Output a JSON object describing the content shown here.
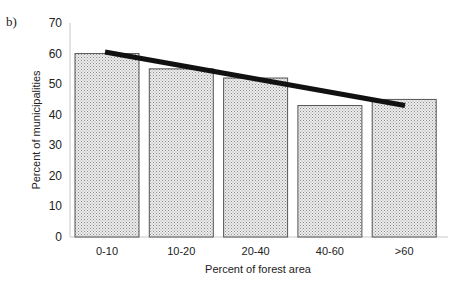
{
  "panel_label": "b)",
  "chart_data": {
    "type": "bar",
    "title": "",
    "xlabel": "Percent of forest area",
    "ylabel": "Percent of municipalities",
    "categories": [
      "0-10",
      "10-20",
      "20-40",
      "40-60",
      ">60"
    ],
    "values": [
      60,
      55,
      52,
      43,
      45
    ],
    "ylim": [
      0,
      70
    ],
    "yticks": [
      0,
      10,
      20,
      30,
      40,
      50,
      60,
      70
    ],
    "grid": false,
    "legend": null,
    "bar_fill": "stippled light gray",
    "trend_line": {
      "type": "linear",
      "start": {
        "category": "0-10",
        "value": 60.5
      },
      "end": {
        "category": ">60",
        "value": 43
      },
      "color": "#111111"
    }
  },
  "colors": {
    "bar_fill": "#e4e4e4",
    "bar_stroke": "#555555",
    "axis": "#bbbbbb",
    "trend": "#111111"
  }
}
